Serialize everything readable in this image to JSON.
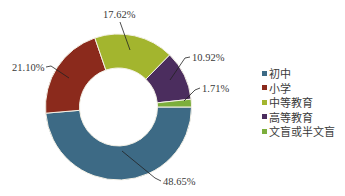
{
  "chart_data": {
    "type": "pie",
    "variant": "donut",
    "title": "",
    "categories": [
      "初中",
      "小学",
      "中等教育",
      "高等教育",
      "文盲或半文盲"
    ],
    "values": [
      48.65,
      21.1,
      17.62,
      10.92,
      1.71
    ],
    "labels": [
      "48.65%",
      "21.10%",
      "17.62%",
      "10.92%",
      "1.71%"
    ],
    "colors": [
      "#3d6a85",
      "#8b2a1c",
      "#a3b52e",
      "#4b2d5e",
      "#7cae3c"
    ],
    "unit": "%",
    "legend_position": "right",
    "start_angle_deg": 90,
    "direction": "clockwise"
  },
  "legend": {
    "items": [
      {
        "label": "初中",
        "color": "#3d6a85"
      },
      {
        "label": "小学",
        "color": "#8b2a1c"
      },
      {
        "label": "中等教育",
        "color": "#a3b52e"
      },
      {
        "label": "高等教育",
        "color": "#4b2d5e"
      },
      {
        "label": "文盲或半文盲",
        "color": "#7cae3c"
      }
    ]
  },
  "slice_labels": [
    {
      "text": "48.65%"
    },
    {
      "text": "21.10%"
    },
    {
      "text": "17.62%"
    },
    {
      "text": "10.92%"
    },
    {
      "text": "1.71%"
    }
  ]
}
